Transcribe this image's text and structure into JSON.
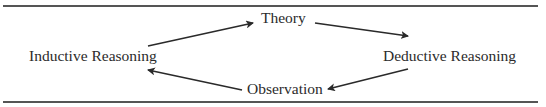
{
  "diagram": {
    "type": "cycle",
    "nodes": [
      {
        "id": "inductive",
        "label": "Inductive Reasoning"
      },
      {
        "id": "theory",
        "label": "Theory"
      },
      {
        "id": "deductive",
        "label": "Deductive Reasoning"
      },
      {
        "id": "observation",
        "label": "Observation"
      }
    ],
    "edges": [
      {
        "from": "inductive",
        "to": "theory"
      },
      {
        "from": "theory",
        "to": "deductive"
      },
      {
        "from": "deductive",
        "to": "observation"
      },
      {
        "from": "observation",
        "to": "inductive"
      }
    ],
    "colors": {
      "line": "#2a2a2a",
      "rule": "#555555"
    }
  }
}
